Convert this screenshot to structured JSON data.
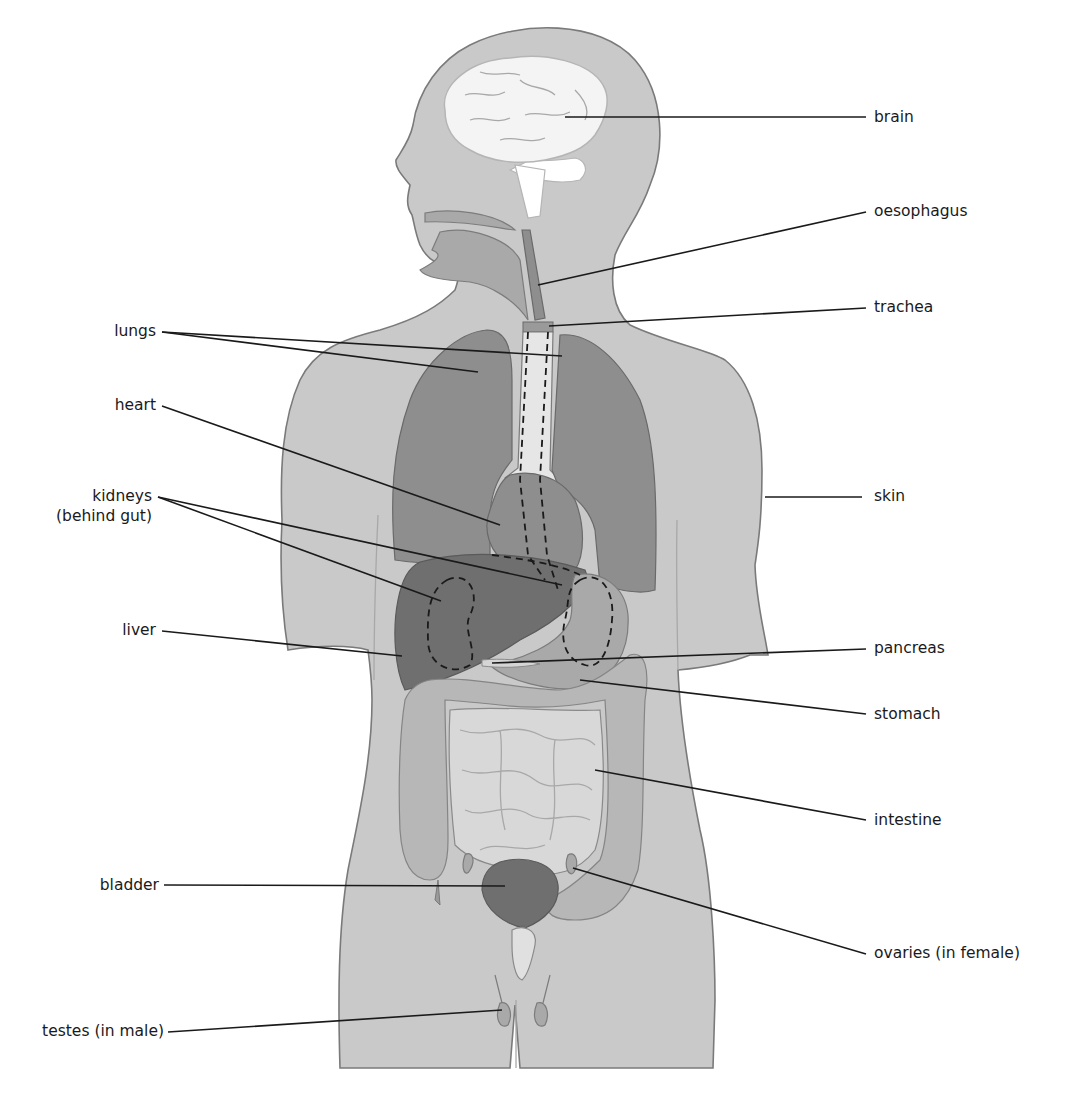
{
  "diagram": {
    "labels": {
      "brain": "brain",
      "oesophagus": "oesophagus",
      "trachea": "trachea",
      "lungs": "lungs",
      "heart": "heart",
      "kidneys_line1": "kidneys",
      "kidneys_line2": "(behind gut)",
      "skin": "skin",
      "liver": "liver",
      "pancreas": "pancreas",
      "stomach": "stomach",
      "intestine": "intestine",
      "bladder": "bladder",
      "ovaries": "ovaries (in female)",
      "testes": "testes (in male)"
    },
    "colors": {
      "background": "#ffffff",
      "skin": "#c9c9c9",
      "outline": "#7a7a7a",
      "brain": "#f4f4f4",
      "lungs": "#8e8e8e",
      "liver": "#6f6f6f",
      "bladder": "#6f6f6f",
      "intestine": "#d8d8d8",
      "colon": "#b7b7b7",
      "leader_line": "#1a1a1a",
      "label_text": "#1a1a1a"
    }
  }
}
